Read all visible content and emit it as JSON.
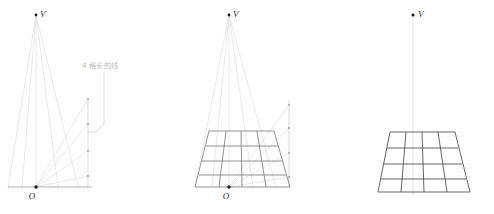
{
  "figure": {
    "title_visible": false,
    "background_color": "#ffffff",
    "panel_count": 3,
    "colors": {
      "ray_light": "#d8dade",
      "ray_lighter": "#e3e5e9",
      "grid_dark": "#4a4a4a",
      "grid_mid": "#8d8f94",
      "baseline": "#8d8f94",
      "point_dot": "#1a1a1a",
      "annotation_text": "#b9bcc2",
      "annotation_line": "#c9ccd1",
      "label_text": "#2b2b2b"
    },
    "panels": [
      {
        "id": "panel-1",
        "name": "rays-and-measuring-line",
        "vanishing_point_label": "V",
        "origin_label": "O",
        "vanishing_point": {
          "x": 36,
          "y": 15
        },
        "origin_point": {
          "x": 36,
          "y": 187
        },
        "baseline": {
          "x1": 8,
          "y1": 187,
          "x2": 92,
          "y2": 187
        },
        "measuring_line": {
          "x": 88,
          "y_top": 99,
          "y_bottom": 187
        },
        "measuring_ticks": [
          {
            "index": 1,
            "x": 88,
            "y": 99
          },
          {
            "index": 2,
            "x": 88,
            "y": 124
          },
          {
            "index": 3,
            "x": 88,
            "y": 151
          },
          {
            "index": 4,
            "x": 88,
            "y": 176
          }
        ],
        "converging_rays_count": 5,
        "diagonal_rays_count": 4,
        "annotation": {
          "text": "4 格长的线",
          "x": 82,
          "y": 68,
          "bracket": {
            "stem_x": 104,
            "stem_top_y": 72,
            "stem_bottom_y": 124,
            "elbow_x": 88,
            "elbow_y": 132
          }
        }
      },
      {
        "id": "panel-2",
        "name": "rays-with-constructed-grid",
        "vanishing_point_label": "V",
        "origin_label": "O",
        "vanishing_point": {
          "x": 229,
          "y": 15
        },
        "origin_point": {
          "x": 229,
          "y": 187
        },
        "baseline": {
          "x1": 195,
          "y1": 187,
          "x2": 293,
          "y2": 187
        },
        "measuring_line": {
          "x": 289,
          "y_top": 99,
          "y_bottom": 187
        },
        "measuring_ticks": [
          {
            "index": 1,
            "x": 289,
            "y": 105
          },
          {
            "index": 2,
            "x": 289,
            "y": 128
          },
          {
            "index": 3,
            "x": 289,
            "y": 153
          },
          {
            "index": 4,
            "x": 289,
            "y": 177
          }
        ],
        "grid": {
          "columns": 4,
          "rows": 4,
          "top_left": {
            "x": 209,
            "y": 131
          },
          "top_right": {
            "x": 274,
            "y": 131
          },
          "bottom_left": {
            "x": 195,
            "y": 187
          },
          "bottom_right": {
            "x": 290,
            "y": 187
          }
        },
        "converging_rays_count": 5,
        "diagonal_rays_count": 4
      },
      {
        "id": "panel-3",
        "name": "finished-perspective-grid",
        "vanishing_point_label": "V",
        "origin_label": "",
        "vanishing_point": {
          "x": 413,
          "y": 15
        },
        "vertical_axis": {
          "x": 413,
          "y_top": 16,
          "y_bottom": 196
        },
        "grid": {
          "columns": 4,
          "rows": 4,
          "top_left": {
            "x": 390,
            "y": 132
          },
          "top_right": {
            "x": 455,
            "y": 132
          },
          "bottom_left": {
            "x": 378,
            "y": 192
          },
          "bottom_right": {
            "x": 470,
            "y": 192
          }
        }
      }
    ]
  }
}
